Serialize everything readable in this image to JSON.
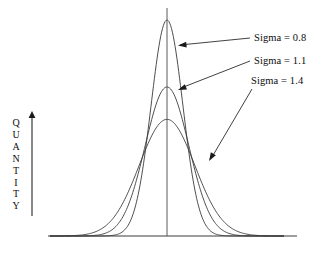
{
  "figure": {
    "background_color": "#ffffff",
    "line_color": "#3a3a3a",
    "text_color": "#0d0d0d",
    "width": 319,
    "height": 257
  },
  "axes": {
    "y_axis_title": "QUANTITY",
    "y_axis_title_letters": [
      "Q",
      "U",
      "A",
      "N",
      "T",
      "I",
      "T",
      "Y"
    ],
    "y_axis_arrow_direction": "up",
    "x_axis_label": "",
    "x_axis": {
      "x_start": 48,
      "x_end": 297,
      "y": 236
    },
    "y_arrow": {
      "x": 32,
      "y_top": 112,
      "y_bottom": 216
    },
    "center_line": {
      "x": 167,
      "y_top": 8,
      "y_bottom": 236
    }
  },
  "chart_data": {
    "type": "line",
    "title": "",
    "subtitle": "",
    "xlabel": "",
    "ylabel": "QUANTITY",
    "xlim": [
      -6,
      6
    ],
    "ylim": [
      0,
      1
    ],
    "grid": false,
    "legend_position": "right-inline-annotations",
    "distribution": "gaussian",
    "mean": 0,
    "series": [
      {
        "name": "Sigma = 0.8",
        "label": "Sigma = 0.8",
        "sigma": 0.8,
        "peak_height": 1.0,
        "color": "#3a3a3a",
        "peak_pixel": {
          "x": 167,
          "y": 20
        },
        "baseline_reach_pixel": {
          "left": 125,
          "right": 209
        },
        "x": [
          -6,
          -5,
          -4,
          -3,
          -2.5,
          -2,
          -1.5,
          -1,
          -0.5,
          0,
          0.5,
          1,
          1.5,
          2,
          2.5,
          3,
          4,
          5,
          6
        ],
        "y": [
          0.0,
          0.0,
          0.0,
          0.009,
          0.026,
          0.073,
          0.174,
          0.458,
          0.821,
          1.0,
          0.821,
          0.458,
          0.174,
          0.073,
          0.026,
          0.009,
          0.0,
          0.0,
          0.0
        ]
      },
      {
        "name": "Sigma = 1.1",
        "label": "Sigma = 1.1",
        "sigma": 1.1,
        "peak_height": 0.69,
        "color": "#3a3a3a",
        "peak_pixel": {
          "x": 167,
          "y": 88
        },
        "baseline_reach_pixel": {
          "left": 86,
          "right": 248
        },
        "x": [
          -6,
          -5,
          -4,
          -3,
          -2.5,
          -2,
          -1.5,
          -1,
          -0.5,
          0,
          0.5,
          1,
          1.5,
          2,
          2.5,
          3,
          4,
          5,
          6
        ],
        "y": [
          0.0,
          0.003,
          0.019,
          0.073,
          0.125,
          0.196,
          0.281,
          0.449,
          0.624,
          0.69,
          0.624,
          0.449,
          0.281,
          0.196,
          0.125,
          0.073,
          0.019,
          0.003,
          0.0
        ]
      },
      {
        "name": "Sigma = 1.4",
        "label": "Sigma = 1.4",
        "sigma": 1.4,
        "peak_height": 0.54,
        "color": "#3a3a3a",
        "peak_pixel": {
          "x": 167,
          "y": 113
        },
        "baseline_reach_pixel": {
          "left": 50,
          "right": 288
        },
        "x": [
          -6,
          -5,
          -4,
          -3,
          -2.5,
          -2,
          -1.5,
          -1,
          -0.5,
          0,
          0.5,
          1,
          1.5,
          2,
          2.5,
          3,
          4,
          5,
          6
        ],
        "y": [
          0.004,
          0.018,
          0.058,
          0.142,
          0.207,
          0.279,
          0.354,
          0.447,
          0.516,
          0.54,
          0.516,
          0.447,
          0.354,
          0.279,
          0.207,
          0.142,
          0.058,
          0.018,
          0.004
        ]
      }
    ]
  },
  "annotations": [
    {
      "name": "annotation-sigma-08",
      "text": "Sigma = 0.8",
      "leader": {
        "x1": 250,
        "y1": 38,
        "x2": 180,
        "y2": 45
      },
      "arrow_tip": {
        "x": 178,
        "y": 45.5
      },
      "arrow_angle_deg": 185
    },
    {
      "name": "annotation-sigma-11",
      "text": "Sigma = 1.1",
      "leader": {
        "x1": 250,
        "y1": 61,
        "x2": 181,
        "y2": 88
      },
      "arrow_tip": {
        "x": 178,
        "y": 90
      },
      "arrow_angle_deg": 201
    },
    {
      "name": "annotation-sigma-14",
      "text": "Sigma = 1.4",
      "leader": {
        "x1": 252,
        "y1": 89,
        "x2": 212,
        "y2": 157
      },
      "arrow_tip": {
        "x": 209,
        "y": 161
      },
      "arrow_angle_deg": 240
    }
  ]
}
